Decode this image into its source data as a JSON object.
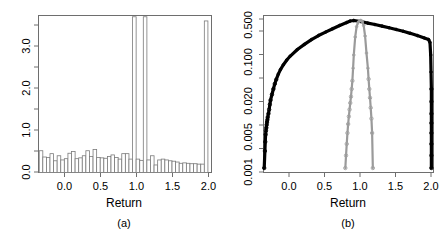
{
  "figure": {
    "width": 444,
    "height": 236,
    "background": "#ffffff"
  },
  "colors": {
    "frame": "#6e6e6e",
    "histogram_outline": "#7a7a7a",
    "black_series": "#000000",
    "gray_series": "#9a9a9a",
    "text": "#000000"
  },
  "panels": [
    {
      "id": "a",
      "caption": "(a)",
      "xlabel": "Return",
      "ylabel": "",
      "xticks": [
        "0.0",
        "0.5",
        "1.0",
        "1.5",
        "2.0"
      ],
      "yticks": [
        "0.0",
        "1.0",
        "2.0",
        "3.0"
      ]
    },
    {
      "id": "b",
      "caption": "(b)",
      "xlabel": "Return",
      "ylabel": "",
      "xticks": [
        "0.0",
        "0.5",
        "1.0",
        "1.5",
        "2.0"
      ],
      "yticks": [
        "0.001",
        "0.005",
        "0.020",
        "0.100",
        "0.500"
      ]
    }
  ],
  "chart_data": [
    {
      "type": "bar",
      "panel": "a",
      "title": "",
      "xlabel": "Return",
      "ylabel": "",
      "caption": "(a)",
      "xlim": [
        -0.38,
        2.03
      ],
      "ylim": [
        0.0,
        3.75
      ],
      "xticks": [
        0.0,
        0.5,
        1.0,
        1.5,
        2.0
      ],
      "xticklabels": [
        "0.0",
        "0.5",
        "1.0",
        "1.5",
        "2.0"
      ],
      "yticks": [
        0.0,
        1.0,
        2.0,
        3.0
      ],
      "yticklabels": [
        "0.0",
        "1.0",
        "2.0",
        "3.0"
      ],
      "grid": false,
      "legend": false,
      "bin_width": 0.05,
      "bin_left_edges": [
        -0.37,
        -0.32,
        -0.27,
        -0.22,
        -0.17,
        -0.12,
        -0.07,
        -0.02,
        0.03,
        0.08,
        0.13,
        0.18,
        0.23,
        0.28,
        0.33,
        0.38,
        0.43,
        0.48,
        0.53,
        0.58,
        0.63,
        0.68,
        0.73,
        0.78,
        0.83,
        0.88,
        0.93,
        0.98,
        1.03,
        1.08,
        1.13,
        1.18,
        1.23,
        1.28,
        1.33,
        1.38,
        1.43,
        1.48,
        1.53,
        1.58,
        1.63,
        1.68,
        1.73,
        1.78,
        1.83,
        1.88,
        1.93
      ],
      "values": [
        0.52,
        0.37,
        0.36,
        0.45,
        0.28,
        0.4,
        0.3,
        0.33,
        0.46,
        0.5,
        0.33,
        0.35,
        0.4,
        0.52,
        0.38,
        0.55,
        0.36,
        0.35,
        0.34,
        0.38,
        0.42,
        0.36,
        0.32,
        0.45,
        0.45,
        0.32,
        3.72,
        0.32,
        0.29,
        3.72,
        0.3,
        0.4,
        0.18,
        0.3,
        0.32,
        0.3,
        0.28,
        0.27,
        0.25,
        0.22,
        0.23,
        0.22,
        0.21,
        0.21,
        0.2,
        0.2,
        3.62
      ],
      "notes": "Density histogram with spike near Return = 1.0 and a tall bar at Return = 2.0"
    },
    {
      "type": "scatter",
      "panel": "b",
      "title": "",
      "xlabel": "Return",
      "ylabel": "",
      "caption": "(b)",
      "xlim": [
        -0.38,
        2.03
      ],
      "ylim": [
        0.001,
        0.6
      ],
      "yscale": "log",
      "xticks": [
        0.0,
        0.5,
        1.0,
        1.5,
        2.0
      ],
      "xticklabels": [
        "0.0",
        "0.5",
        "1.0",
        "1.5",
        "2.0"
      ],
      "yticks": [
        0.001,
        0.005,
        0.02,
        0.1,
        0.5
      ],
      "yticklabels": [
        "0.001",
        "0.005",
        "0.020",
        "0.100",
        "0.500"
      ],
      "grid": false,
      "legend": false,
      "series": [
        {
          "name": "black-series",
          "color": "#000000",
          "marker": "circle",
          "x": [
            -0.37,
            -0.36,
            -0.355,
            -0.35,
            -0.345,
            -0.34,
            -0.335,
            -0.33,
            -0.325,
            -0.32,
            -0.31,
            -0.3,
            -0.29,
            -0.28,
            -0.26,
            -0.24,
            -0.22,
            -0.2,
            -0.17,
            -0.14,
            -0.1,
            -0.05,
            0.0,
            0.1,
            0.2,
            0.3,
            0.4,
            0.5,
            0.6,
            0.7,
            0.8,
            0.85,
            0.9,
            1.0,
            1.1,
            1.2,
            1.3,
            1.4,
            1.5,
            1.6,
            1.7,
            1.8,
            1.9,
            1.96,
            1.98,
            1.99,
            1.995,
            2.0,
            2.0,
            2.0,
            2.0,
            2.0,
            2.0,
            2.0,
            2.0
          ],
          "y": [
            0.0012,
            0.0024,
            0.0035,
            0.0047,
            0.0055,
            0.0062,
            0.007,
            0.0078,
            0.0086,
            0.0095,
            0.011,
            0.013,
            0.016,
            0.019,
            0.024,
            0.03,
            0.037,
            0.044,
            0.055,
            0.066,
            0.08,
            0.098,
            0.115,
            0.15,
            0.185,
            0.225,
            0.265,
            0.305,
            0.35,
            0.4,
            0.45,
            0.48,
            0.49,
            0.47,
            0.44,
            0.415,
            0.39,
            0.365,
            0.34,
            0.315,
            0.29,
            0.265,
            0.24,
            0.225,
            0.2,
            0.12,
            0.06,
            0.03,
            0.018,
            0.011,
            0.0075,
            0.005,
            0.0032,
            0.002,
            0.0012
          ]
        },
        {
          "name": "gray-series",
          "color": "#9a9a9a",
          "marker": "circle",
          "x": [
            0.78,
            0.79,
            0.8,
            0.81,
            0.82,
            0.83,
            0.84,
            0.85,
            0.86,
            0.87,
            0.88,
            0.89,
            0.9,
            0.92,
            0.94,
            0.96,
            0.98,
            1.0,
            1.02,
            1.04,
            1.06,
            1.08,
            1.1,
            1.11,
            1.12,
            1.13,
            1.14,
            1.15,
            1.16,
            1.17
          ],
          "y": [
            0.0012,
            0.002,
            0.0032,
            0.005,
            0.0072,
            0.0098,
            0.013,
            0.017,
            0.022,
            0.03,
            0.042,
            0.07,
            0.12,
            0.25,
            0.38,
            0.45,
            0.48,
            0.49,
            0.47,
            0.4,
            0.26,
            0.13,
            0.07,
            0.045,
            0.03,
            0.021,
            0.014,
            0.009,
            0.005,
            0.0012
          ]
        }
      ],
      "notes": "Log-scale y axis; thick black arch spanning full Return range plus narrow gray spike centered at Return = 1.0"
    }
  ]
}
